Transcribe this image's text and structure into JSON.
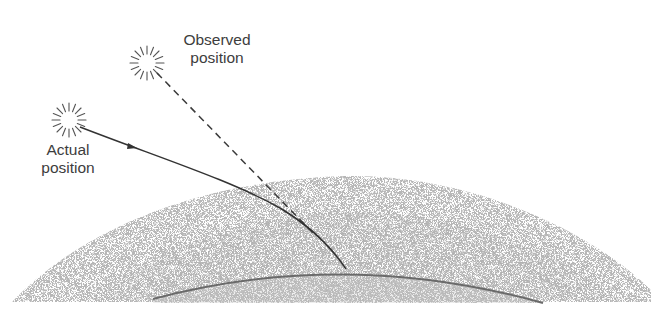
{
  "diagram": {
    "labels": {
      "observed": {
        "line1": "Observed",
        "line2": "position"
      },
      "actual": {
        "line1": "Actual",
        "line2": "position"
      }
    },
    "elements": {
      "actual_sun": {
        "cx": 69,
        "cy": 120
      },
      "observed_sun": {
        "cx": 147,
        "cy": 63
      },
      "observer_point": {
        "x": 346,
        "y": 269
      }
    },
    "colors": {
      "line": "#3a3a3a",
      "atmosphere": "#bdbdbd",
      "earth_fill": "#c8c8c8",
      "earth_edge": "#6a6a6a",
      "text": "#3d3d3d"
    }
  }
}
